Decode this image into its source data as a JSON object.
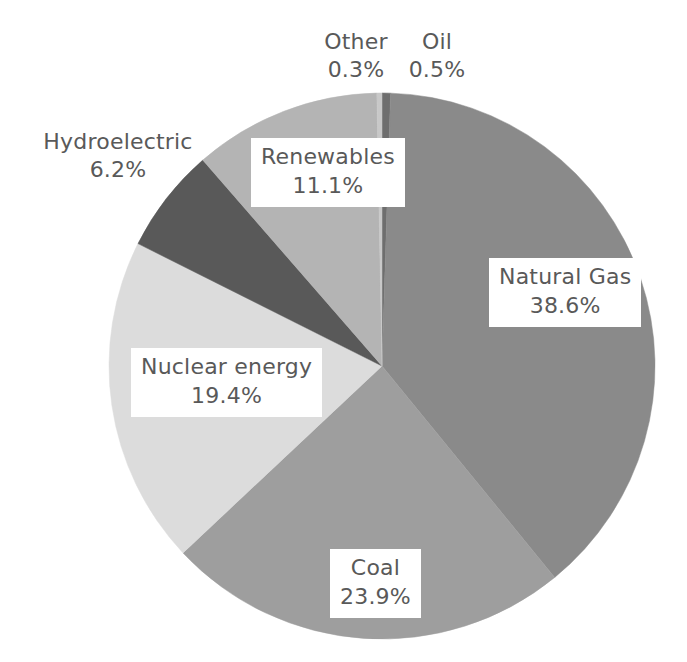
{
  "chart_data": {
    "type": "pie",
    "title": "",
    "subtitle": "",
    "xlabel": "",
    "ylabel": "",
    "legend_position": "none",
    "grid": false,
    "units": "percent",
    "start_angle_deg": 0,
    "direction": "clockwise",
    "categories": [
      "Oil",
      "Natural Gas",
      "Coal",
      "Nuclear energy",
      "Hydroelectric",
      "Renewables",
      "Other"
    ],
    "values": [
      0.5,
      38.6,
      23.9,
      19.4,
      6.2,
      11.1,
      0.3
    ],
    "total": 100.0,
    "slices": [
      {
        "label": "Oil",
        "value": 0.5,
        "display_value": "0.5%",
        "color": "#6e6e6e",
        "label_style": "outside"
      },
      {
        "label": "Natural Gas",
        "value": 38.6,
        "display_value": "38.6%",
        "color": "#8a8a8a",
        "label_style": "boxed"
      },
      {
        "label": "Coal",
        "value": 23.9,
        "display_value": "23.9%",
        "color": "#9e9e9e",
        "label_style": "boxed"
      },
      {
        "label": "Nuclear energy",
        "value": 19.4,
        "display_value": "19.4%",
        "color": "#dcdcdc",
        "label_style": "boxed"
      },
      {
        "label": "Hydroelectric",
        "value": 6.2,
        "display_value": "6.2%",
        "color": "#595959",
        "label_style": "outside"
      },
      {
        "label": "Renewables",
        "value": 11.1,
        "display_value": "11.1%",
        "color": "#b4b4b4",
        "label_style": "boxed"
      },
      {
        "label": "Other",
        "value": 0.3,
        "display_value": "0.3%",
        "color": "#c8c8c8",
        "label_style": "outside"
      }
    ]
  },
  "labels": {
    "other": {
      "name": "Other",
      "value": "0.3%"
    },
    "oil": {
      "name": "Oil",
      "value": "0.5%"
    },
    "hydro": {
      "name": "Hydroelectric",
      "value": "6.2%"
    },
    "renewables": {
      "name": "Renewables",
      "value": "11.1%"
    },
    "natural_gas": {
      "name": "Natural Gas",
      "value": "38.6%"
    },
    "nuclear": {
      "name": "Nuclear energy",
      "value": "19.4%"
    },
    "coal": {
      "name": "Coal",
      "value": "23.9%"
    }
  },
  "colors": {
    "text": "#595959",
    "background": "#ffffff",
    "natural_gas": "#8a8a8a",
    "coal": "#9e9e9e",
    "nuclear": "#dcdcdc",
    "hydroelectric": "#595959",
    "renewables": "#b4b4b4",
    "other": "#c8c8c8",
    "oil": "#6e6e6e"
  },
  "geometry": {
    "center_x": 382,
    "center_y": 366,
    "radius": 273
  }
}
